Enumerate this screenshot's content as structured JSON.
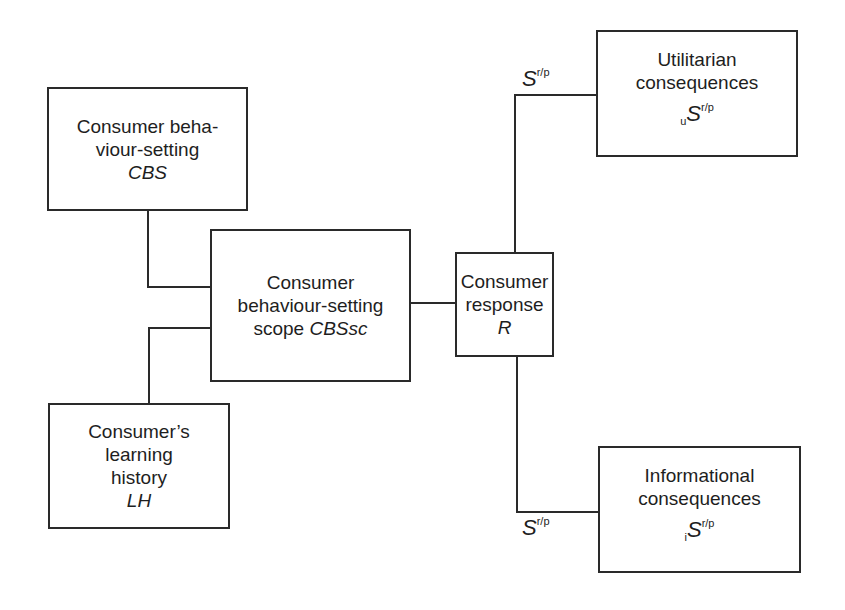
{
  "diagram": {
    "nodes": {
      "cbs": {
        "lines": [
          "Consumer beha-",
          "viour-setting"
        ],
        "symbol": "CBS"
      },
      "cbssc": {
        "lines": [
          "Consumer",
          "behaviour-setting"
        ],
        "last_plain": "scope ",
        "symbol": "CBSsc"
      },
      "lh": {
        "lines": [
          "Consumer’s",
          "learning",
          "history"
        ],
        "symbol": "LH"
      },
      "response": {
        "lines": [
          "Consumer",
          "response"
        ],
        "symbol": "R"
      },
      "utilitarian": {
        "lines": [
          "Utilitarian",
          "consequences"
        ],
        "sub": "u",
        "symbol": "S",
        "sup": "r/p"
      },
      "informational": {
        "lines": [
          "Informational",
          "consequences"
        ],
        "sub": "i",
        "symbol": "S",
        "sup": "r/p"
      }
    },
    "edge_labels": {
      "top": {
        "symbol": "S",
        "sup": "r/p"
      },
      "bottom": {
        "symbol": "S",
        "sup": "r/p"
      }
    },
    "edges": [
      [
        "cbs",
        "cbssc"
      ],
      [
        "lh",
        "cbssc"
      ],
      [
        "cbssc",
        "response"
      ],
      [
        "response",
        "utilitarian"
      ],
      [
        "response",
        "informational"
      ]
    ]
  }
}
